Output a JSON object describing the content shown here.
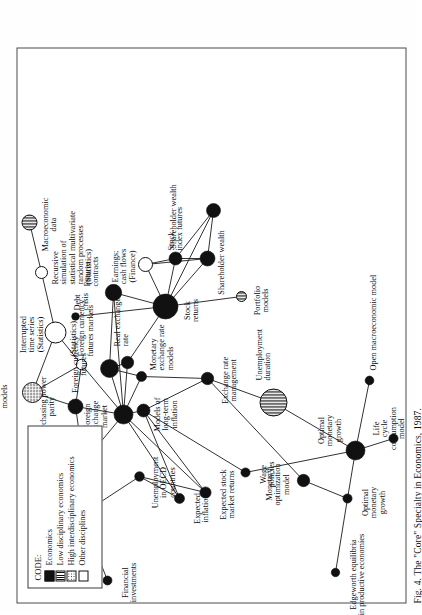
{
  "figure": {
    "caption": "Fig. 4. The \"Core\" Specialty in Economics, 1987.",
    "frame_color": "#4a4a4a"
  },
  "legend": {
    "title": "CODE:",
    "items": [
      {
        "label": "Economics",
        "swatch": "solid",
        "color": "#111111"
      },
      {
        "label": "Low disciplinary economics",
        "swatch": "stripe",
        "color": "#111111"
      },
      {
        "label": "High interdisciplinary economics",
        "swatch": "dot",
        "color": "#111111"
      },
      {
        "label": "Other disciplines",
        "swatch": "open",
        "color": "#ffffff"
      }
    ]
  },
  "chart_data": {
    "type": "scatter",
    "title": "Fig. 4. The \"Core\" Specialty in Economics, 1987.",
    "xlabel": "",
    "ylabel": "",
    "grid": false,
    "legend_position": "top-left",
    "node_categories": [
      "Economics",
      "Low disciplinary economics",
      "High interdisciplinary economics",
      "Other disciplines"
    ],
    "nodes": [
      {
        "id": "financial_investments",
        "label": "Financial\ninvestments",
        "x": 22,
        "y": 90,
        "r": 4.5,
        "fill": "solid",
        "lx": 20,
        "ly": 104,
        "align": "c"
      },
      {
        "id": "post_keynsian",
        "label": "Post-Keynsian\nmonetary theory",
        "x": 88,
        "y": 64,
        "r": 11.5,
        "fill": "solid",
        "lx": 86,
        "ly": 28,
        "align": "c"
      },
      {
        "id": "edgeworth",
        "label": "Edgeworth equilibria\nin productive economies",
        "x": 30,
        "y": 318,
        "r": 4.2,
        "fill": "solid",
        "lx": 28,
        "ly": 332,
        "align": "c"
      },
      {
        "id": "optimal_monetary_growth_a",
        "label": "Optimal\nmonetary\ngrowth",
        "x": 104,
        "y": 330,
        "r": 4.6,
        "fill": "solid",
        "lx": 100,
        "ly": 344,
        "align": "c"
      },
      {
        "id": "optimal_monetary_growth_b",
        "label": "Optimal\nmonetary\ngrowth",
        "x": 152,
        "y": 338,
        "r": 9.5,
        "fill": "solid",
        "lx": 172,
        "ly": 300,
        "align": "c"
      },
      {
        "id": "life_cycle",
        "label": "Life\ncycle\nconsumption\nmodel",
        "x": 164,
        "y": 376,
        "r": 4.6,
        "fill": "solid",
        "lx": 174,
        "ly": 355,
        "align": "c"
      },
      {
        "id": "open_macro",
        "label": "Open macroeconomic model",
        "x": 222,
        "y": 352,
        "r": 4.4,
        "fill": "solid",
        "lx": 232,
        "ly": 352,
        "align": "l"
      },
      {
        "id": "monetary_optimization",
        "label": "Monetary\noptimization\nmodel",
        "x": 122,
        "y": 286,
        "r": 6.2,
        "fill": "solid",
        "lx": 118,
        "ly": 248,
        "align": "c"
      },
      {
        "id": "wage_policies",
        "label": "Wage\npolicies",
        "x": 130,
        "y": 228,
        "r": 4.6,
        "fill": "solid",
        "lx": 128,
        "ly": 242,
        "align": "c"
      },
      {
        "id": "expected_stock_returns",
        "label": "Expected stock\nmarket returns",
        "x": 110,
        "y": 188,
        "r": 5.6,
        "fill": "solid",
        "lx": 108,
        "ly": 202,
        "align": "c"
      },
      {
        "id": "expected_inflation",
        "label": "Expected\ninflation",
        "x": 104,
        "y": 162,
        "r": 5.0,
        "fill": "solid",
        "lx": 94,
        "ly": 176,
        "align": "c"
      },
      {
        "id": "unemployment_oecd",
        "label": "Unemployment\nin OECD\ncountries",
        "x": 126,
        "y": 122,
        "r": 4.8,
        "fill": "solid",
        "lx": 120,
        "ly": 134,
        "align": "c"
      },
      {
        "id": "foreign_exchange_market_a",
        "label": "Foreign exchange\nmarket",
        "x": 140,
        "y": 66,
        "r": 7.0,
        "fill": "solid",
        "lx": 136,
        "ly": 30,
        "align": "c"
      },
      {
        "id": "purchasing_power_parity",
        "label": "Purchasing power\nparity",
        "x": 196,
        "y": 58,
        "r": 7.5,
        "fill": "solid",
        "lx": 196,
        "ly": 22,
        "align": "c"
      },
      {
        "id": "composite_forecasting",
        "label": "Composite forecasting:\nLinear transfer-function\nmodels",
        "x": 210,
        "y": 15,
        "r": 10.0,
        "fill": "dot",
        "lx": 206,
        "ly": -34,
        "align": "c"
      },
      {
        "id": "foreign_currency_futures_markets",
        "label": "(Statistics)\nForeign currency\nfutures markets",
        "x": 238,
        "y": 64,
        "r": 5.2,
        "fill": "open",
        "lx": 246,
        "ly": 52,
        "align": "l"
      },
      {
        "id": "interrupted_time_series",
        "label": "Interrupted\ntime series\n(Statistics)",
        "x": 270,
        "y": 38,
        "r": 10.5,
        "fill": "open",
        "lx": 268,
        "ly": 2,
        "align": "c"
      },
      {
        "id": "recursive_simulation",
        "label": "Recursive\nsimulation of\nstatistical multivariate\nrandom processes\n(Statistics)",
        "x": 330,
        "y": 24,
        "r": 6.0,
        "fill": "open",
        "lx": 318,
        "ly": 34,
        "align": "l"
      },
      {
        "id": "macroeconomic_data",
        "label": "Macroeconomic\ndata",
        "x": 380,
        "y": 12,
        "r": 7.5,
        "fill": "stripe",
        "lx": 378,
        "ly": 24,
        "align": "c"
      },
      {
        "id": "foreign_exchange_market_b",
        "label": "Foreign\nexchange\nmarket",
        "x": 188,
        "y": 106,
        "r": 9.5,
        "fill": "solid",
        "lx": 186,
        "ly": 66,
        "align": "c"
      },
      {
        "id": "foreign_currency_futures",
        "label": "Foreign currency\nfutures",
        "x": 234,
        "y": 92,
        "r": 9.0,
        "fill": "solid",
        "lx": 238,
        "ly": 54,
        "align": "c"
      },
      {
        "id": "debt_crisis",
        "label": "Debt\ncrisis",
        "x": 286,
        "y": 58,
        "r": 3.8,
        "fill": "solid",
        "lx": 292,
        "ly": 56,
        "align": "l"
      },
      {
        "id": "futures_contracts",
        "label": "Futures\ncontracts",
        "x": 310,
        "y": 96,
        "r": 8.2,
        "fill": "solid",
        "lx": 316,
        "ly": 66,
        "align": "l"
      },
      {
        "id": "models_long_term_inflation",
        "label": "Models of\nlong-term\ninflation",
        "x": 192,
        "y": 126,
        "r": 6.5,
        "fill": "solid",
        "lx": 188,
        "ly": 136,
        "align": "c"
      },
      {
        "id": "monetary_exchange_models",
        "label": "Monetary\nexchange rate\nmodels",
        "x": 226,
        "y": 124,
        "r": 5.0,
        "fill": "solid",
        "lx": 232,
        "ly": 132,
        "align": "l"
      },
      {
        "id": "real_exchange_rate",
        "label": "Real exchange\nrate",
        "x": 240,
        "y": 110,
        "r": 6.2,
        "fill": "solid",
        "lx": 256,
        "ly": 96,
        "align": "l"
      },
      {
        "id": "exchange_rate_management",
        "label": "Exchange rate\nmanagement",
        "x": 224,
        "y": 190,
        "r": 6.2,
        "fill": "solid",
        "lx": 222,
        "ly": 204,
        "align": "c"
      },
      {
        "id": "unemployment_duration",
        "label": "Unemployment\nduration",
        "x": 200,
        "y": 256,
        "r": 13.5,
        "fill": "stripe",
        "lx": 222,
        "ly": 238,
        "align": "l"
      },
      {
        "id": "stock_returns",
        "label": "Stock\nreturns",
        "x": 296,
        "y": 148,
        "r": 12.5,
        "fill": "solid",
        "lx": 292,
        "ly": 166,
        "align": "c"
      },
      {
        "id": "earnings_cash_flows",
        "label": "Earnings;\ncash flows\n(Finance)",
        "x": 338,
        "y": 128,
        "r": 7.0,
        "fill": "open",
        "lx": 336,
        "ly": 94,
        "align": "c"
      },
      {
        "id": "stock_index_futures",
        "label": "Stock\nindex futures",
        "x": 344,
        "y": 158,
        "r": 6.5,
        "fill": "solid",
        "lx": 352,
        "ly": 150,
        "align": "l"
      },
      {
        "id": "shareholder_wealth_a",
        "label": "Shareholder wealth",
        "x": 344,
        "y": 190,
        "r": 7.5,
        "fill": "solid",
        "lx": 340,
        "ly": 200,
        "align": "c"
      },
      {
        "id": "shareholder_wealth_b",
        "label": "Shareholder wealth",
        "x": 392,
        "y": 196,
        "r": 7.0,
        "fill": "solid",
        "lx": 386,
        "ly": 152,
        "align": "c"
      },
      {
        "id": "portfolio_models",
        "label": "Portfolio\nmodels",
        "x": 306,
        "y": 224,
        "r": 5.0,
        "fill": "stripe",
        "lx": 302,
        "ly": 236,
        "align": "c"
      }
    ],
    "edges": [
      [
        "financial_investments",
        "post_keynsian"
      ],
      [
        "post_keynsian",
        "unemployment_oecd"
      ],
      [
        "unemployment_oecd",
        "expected_inflation"
      ],
      [
        "unemployment_oecd",
        "expected_stock_returns"
      ],
      [
        "expected_inflation",
        "models_long_term_inflation"
      ],
      [
        "expected_stock_returns",
        "foreign_exchange_market_b"
      ],
      [
        "expected_inflation",
        "foreign_exchange_market_b"
      ],
      [
        "foreign_exchange_market_a",
        "purchasing_power_parity"
      ],
      [
        "foreign_exchange_market_a",
        "foreign_exchange_market_b"
      ],
      [
        "purchasing_power_parity",
        "composite_forecasting"
      ],
      [
        "purchasing_power_parity",
        "foreign_currency_futures_markets"
      ],
      [
        "purchasing_power_parity",
        "foreign_exchange_market_b"
      ],
      [
        "composite_forecasting",
        "interrupted_time_series"
      ],
      [
        "composite_forecasting",
        "foreign_currency_futures_markets"
      ],
      [
        "interrupted_time_series",
        "recursive_simulation"
      ],
      [
        "interrupted_time_series",
        "foreign_currency_futures_markets"
      ],
      [
        "recursive_simulation",
        "macroeconomic_data"
      ],
      [
        "foreign_currency_futures_markets",
        "foreign_exchange_market_b"
      ],
      [
        "foreign_currency_futures",
        "foreign_exchange_market_b"
      ],
      [
        "foreign_currency_futures",
        "real_exchange_rate"
      ],
      [
        "foreign_currency_futures",
        "monetary_exchange_models"
      ],
      [
        "foreign_currency_futures",
        "futures_contracts"
      ],
      [
        "debt_crisis",
        "stock_returns"
      ],
      [
        "futures_contracts",
        "stock_returns"
      ],
      [
        "futures_contracts",
        "foreign_exchange_market_b"
      ],
      [
        "foreign_exchange_market_b",
        "models_long_term_inflation"
      ],
      [
        "foreign_exchange_market_b",
        "monetary_exchange_models"
      ],
      [
        "foreign_exchange_market_b",
        "real_exchange_rate"
      ],
      [
        "models_long_term_inflation",
        "exchange_rate_management"
      ],
      [
        "models_long_term_inflation",
        "wage_policies"
      ],
      [
        "models_long_term_inflation",
        "expected_stock_returns"
      ],
      [
        "monetary_exchange_models",
        "exchange_rate_management"
      ],
      [
        "real_exchange_rate",
        "stock_returns"
      ],
      [
        "exchange_rate_management",
        "monetary_optimization"
      ],
      [
        "exchange_rate_management",
        "unemployment_duration"
      ],
      [
        "wage_policies",
        "optimal_monetary_growth_b"
      ],
      [
        "monetary_optimization",
        "optimal_monetary_growth_a"
      ],
      [
        "unemployment_duration",
        "optimal_monetary_growth_b"
      ],
      [
        "optimal_monetary_growth_b",
        "optimal_monetary_growth_a"
      ],
      [
        "optimal_monetary_growth_a",
        "edgeworth"
      ],
      [
        "optimal_monetary_growth_b",
        "life_cycle"
      ],
      [
        "optimal_monetary_growth_b",
        "open_macro"
      ],
      [
        "stock_returns",
        "earnings_cash_flows"
      ],
      [
        "stock_returns",
        "stock_index_futures"
      ],
      [
        "stock_returns",
        "shareholder_wealth_a"
      ],
      [
        "stock_returns",
        "portfolio_models"
      ],
      [
        "stock_returns",
        "shareholder_wealth_b"
      ],
      [
        "earnings_cash_flows",
        "stock_index_futures"
      ],
      [
        "earnings_cash_flows",
        "shareholder_wealth_a"
      ],
      [
        "stock_index_futures",
        "shareholder_wealth_a"
      ],
      [
        "stock_index_futures",
        "shareholder_wealth_b"
      ],
      [
        "shareholder_wealth_a",
        "shareholder_wealth_b"
      ]
    ]
  }
}
